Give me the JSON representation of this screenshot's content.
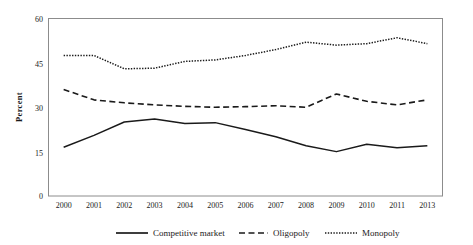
{
  "chart_data": {
    "type": "line",
    "title": "",
    "xlabel": "",
    "ylabel": "Percent",
    "categories": [
      "2000",
      "2001",
      "2002",
      "2003",
      "2004",
      "2005",
      "2006",
      "2007",
      "2008",
      "2009",
      "2010",
      "2011",
      "2013"
    ],
    "x_tick_labels": [
      "2000",
      "2001",
      "2002",
      "2003",
      "2004",
      "2005",
      "2006",
      "2007",
      "2008",
      "2009",
      "2010",
      "2011",
      "2013"
    ],
    "y_tick_labels": [
      "0",
      "15",
      "30",
      "45",
      "60"
    ],
    "y_ticks": [
      0,
      15,
      30,
      45,
      60
    ],
    "ylim": [
      0,
      60
    ],
    "grid": false,
    "legend_position": "bottom",
    "series": [
      {
        "name": "Competitive market",
        "style": "solid",
        "color": "#1a1a1a",
        "values": [
          16.5,
          20.5,
          25.0,
          26.0,
          24.5,
          24.8,
          22.5,
          20.0,
          17.0,
          15.0,
          17.5,
          16.3,
          17.0
        ]
      },
      {
        "name": "Oligopoly",
        "style": "dashed",
        "color": "#1a1a1a",
        "values": [
          36.0,
          32.5,
          31.5,
          30.8,
          30.3,
          30.0,
          30.2,
          30.5,
          30.0,
          34.5,
          32.0,
          30.8,
          32.5
        ]
      },
      {
        "name": "Monopoly",
        "style": "dotted",
        "color": "#1a1a1a",
        "values": [
          47.5,
          47.5,
          43.0,
          43.2,
          45.5,
          46.0,
          47.5,
          49.5,
          52.0,
          51.0,
          51.5,
          53.5,
          51.5
        ]
      }
    ]
  },
  "legend": {
    "items": [
      {
        "label": "Competitive market",
        "style": "solid"
      },
      {
        "label": "Oligopoly",
        "style": "dashed"
      },
      {
        "label": "Monopoly",
        "style": "dotted"
      }
    ]
  },
  "axes": {
    "y_title": "Percent"
  }
}
